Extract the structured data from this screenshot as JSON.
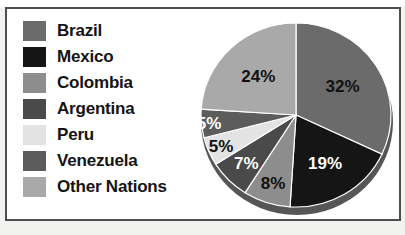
{
  "frame": {
    "border_color": "#4e4e4e",
    "background": "#ffffff",
    "page_background": "#f2f2f0"
  },
  "title_fragment": "",
  "legend": {
    "position": "left",
    "items": [
      {
        "label": "Brazil",
        "color": "#6b6b6b"
      },
      {
        "label": "Mexico",
        "color": "#151515"
      },
      {
        "label": "Colombia",
        "color": "#8d8d8d"
      },
      {
        "label": "Argentina",
        "color": "#4a4a4a"
      },
      {
        "label": "Peru",
        "color": "#e3e3e3"
      },
      {
        "label": "Venezuela",
        "color": "#5c5c5c"
      },
      {
        "label": "Other Nations",
        "color": "#a9a9a9"
      }
    ]
  },
  "chart_data": {
    "type": "pie",
    "title": "",
    "xlabel": "",
    "ylabel": "",
    "start_angle_deg": 0,
    "direction": "clockwise",
    "legend_position": "left",
    "grid": false,
    "categories": [
      "Brazil",
      "Mexico",
      "Colombia",
      "Argentina",
      "Peru",
      "Venezuela",
      "Other Nations"
    ],
    "values": [
      32,
      19,
      8,
      7,
      5,
      5,
      24
    ],
    "labels": [
      "32%",
      "19%",
      "8%",
      "7%",
      "5%",
      "5%",
      "24%"
    ],
    "colors": [
      "#6b6b6b",
      "#151515",
      "#8d8d8d",
      "#4a4a4a",
      "#e3e3e3",
      "#5c5c5c",
      "#a9a9a9"
    ],
    "label_text_colors": [
      "#111111",
      "#ffffff",
      "#111111",
      "#ffffff",
      "#111111",
      "#ffffff",
      "#111111"
    ],
    "units": "percent",
    "total": 100
  }
}
